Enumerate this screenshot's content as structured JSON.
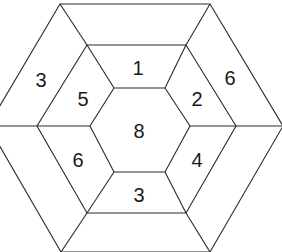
{
  "diagram": {
    "type": "nested-hexagon-puzzle",
    "rings": [
      "outer",
      "middle",
      "inner"
    ],
    "center": {
      "label": "8"
    },
    "middle_ring": {
      "top": "1",
      "upper_right": "2",
      "lower_right": "4",
      "bottom": "3",
      "lower_left": "6",
      "upper_left": "5"
    },
    "outer_ring": {
      "upper_left": "3",
      "upper_right": "6"
    },
    "colors": {
      "line": "#2a2a2a",
      "text": "#1a1a1a",
      "background": "#ffffff"
    }
  }
}
